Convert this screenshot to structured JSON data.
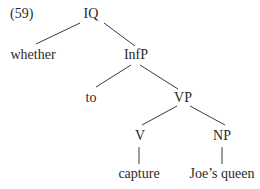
{
  "example_number": "(59)",
  "tree": {
    "nodes": [
      {
        "id": "IQ",
        "label": "IQ",
        "x": 91,
        "y": 6
      },
      {
        "id": "whether",
        "label": "whether",
        "x": 33,
        "y": 47
      },
      {
        "id": "InfP",
        "label": "InfP",
        "x": 136,
        "y": 47
      },
      {
        "id": "to",
        "label": "to",
        "x": 91,
        "y": 90
      },
      {
        "id": "VP",
        "label": "VP",
        "x": 183,
        "y": 90
      },
      {
        "id": "V",
        "label": "V",
        "x": 140,
        "y": 128
      },
      {
        "id": "NP",
        "label": "NP",
        "x": 222,
        "y": 128
      },
      {
        "id": "capture",
        "label": "capture",
        "x": 139,
        "y": 166
      },
      {
        "id": "joes_queen",
        "label": "Joe’s queen",
        "x": 222,
        "y": 166
      }
    ],
    "edges": [
      {
        "from": "IQ",
        "to": "whether",
        "x1": 80,
        "y1": 23,
        "x2": 36,
        "y2": 44
      },
      {
        "from": "IQ",
        "to": "InfP",
        "x1": 104,
        "y1": 23,
        "x2": 135,
        "y2": 46
      },
      {
        "from": "InfP",
        "to": "to",
        "x1": 131,
        "y1": 65,
        "x2": 96,
        "y2": 87
      },
      {
        "from": "InfP",
        "to": "VP",
        "x1": 140,
        "y1": 65,
        "x2": 178,
        "y2": 89
      },
      {
        "from": "VP",
        "to": "V",
        "x1": 177,
        "y1": 106,
        "x2": 142,
        "y2": 125
      },
      {
        "from": "VP",
        "to": "NP",
        "x1": 190,
        "y1": 106,
        "x2": 225,
        "y2": 125
      },
      {
        "from": "V",
        "to": "capture",
        "x1": 139,
        "y1": 147,
        "x2": 139,
        "y2": 164
      },
      {
        "from": "NP",
        "to": "joes_queen",
        "x1": 222,
        "y1": 147,
        "x2": 222,
        "y2": 164
      }
    ]
  }
}
